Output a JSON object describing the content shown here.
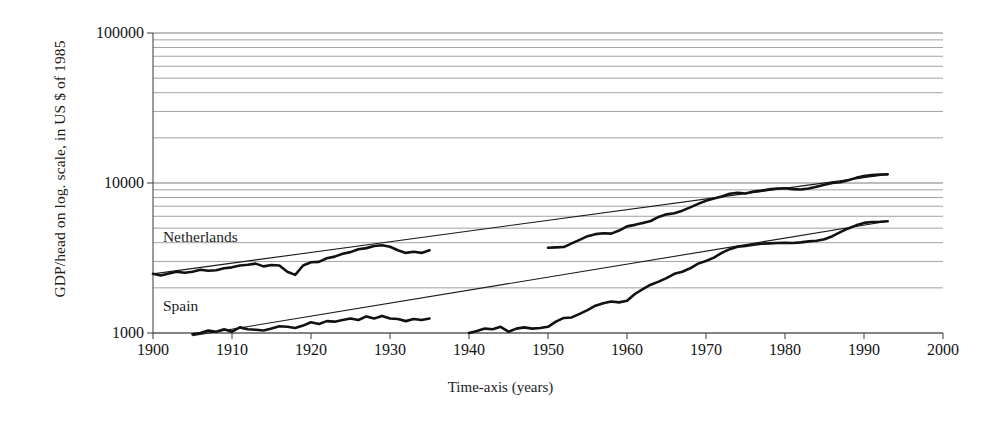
{
  "chart_data": {
    "type": "line",
    "title": "",
    "xlabel": "Time-axis (years)",
    "ylabel": "GDP/head on log. scale, in US $ of 1985",
    "yscale": "log",
    "ylim": [
      1000,
      100000
    ],
    "xlim": [
      1900,
      2000
    ],
    "grid": true,
    "grid_style": "horizontal log minor gridlines",
    "legend_position": "inline labels at left of curves",
    "ytick_labels": [
      "1000",
      "10000",
      "100000"
    ],
    "ytick_values": [
      1000,
      10000,
      100000
    ],
    "xtick_labels": [
      "1900",
      "1910",
      "1920",
      "1930",
      "1940",
      "1950",
      "1960",
      "1970",
      "1980",
      "1990",
      "2000"
    ],
    "xtick_values": [
      1900,
      1910,
      1920,
      1930,
      1940,
      1950,
      1960,
      1970,
      1980,
      1990,
      2000
    ],
    "annotations": [
      {
        "text": "Netherlands",
        "x": 1901,
        "y": 4300
      },
      {
        "text": "Spain",
        "x": 1901,
        "y": 1500
      }
    ],
    "series": [
      {
        "name": "Netherlands",
        "style": "thick black line",
        "segments": [
          {
            "label": "pre-war",
            "x": [
              1900,
              1901,
              1902,
              1903,
              1904,
              1905,
              1906,
              1907,
              1908,
              1909,
              1910,
              1911,
              1912,
              1913,
              1914,
              1915,
              1916,
              1917,
              1918,
              1919,
              1920,
              1921,
              1922,
              1923,
              1924,
              1925,
              1926,
              1927,
              1928,
              1929,
              1930,
              1931,
              1932,
              1933,
              1934,
              1935
            ],
            "y": [
              2480,
              2420,
              2490,
              2560,
              2520,
              2560,
              2640,
              2600,
              2620,
              2700,
              2740,
              2820,
              2850,
              2900,
              2780,
              2840,
              2820,
              2560,
              2440,
              2820,
              2960,
              2980,
              3150,
              3230,
              3380,
              3460,
              3620,
              3680,
              3800,
              3850,
              3760,
              3560,
              3420,
              3480,
              3420,
              3560
            ]
          },
          {
            "label": "post-war",
            "x": [
              1950,
              1951,
              1952,
              1953,
              1954,
              1955,
              1956,
              1957,
              1958,
              1959,
              1960,
              1961,
              1962,
              1963,
              1964,
              1965,
              1966,
              1967,
              1968,
              1969,
              1970,
              1971,
              1972,
              1973,
              1974,
              1975,
              1976,
              1977,
              1978,
              1979,
              1980,
              1981,
              1982,
              1983,
              1984,
              1985,
              1986,
              1987,
              1988,
              1989,
              1990,
              1991,
              1992,
              1993
            ],
            "y": [
              3700,
              3720,
              3740,
              3960,
              4180,
              4420,
              4560,
              4620,
              4600,
              4820,
              5140,
              5260,
              5420,
              5580,
              5940,
              6180,
              6280,
              6540,
              6880,
              7260,
              7620,
              7880,
              8120,
              8480,
              8620,
              8520,
              8780,
              8900,
              9080,
              9200,
              9220,
              9100,
              9050,
              9180,
              9440,
              9720,
              10020,
              10120,
              10420,
              10820,
              11120,
              11280,
              11400,
              11420
            ]
          }
        ]
      },
      {
        "name": "Spain",
        "style": "thick black line",
        "segments": [
          {
            "label": "pre-war",
            "x": [
              1905,
              1906,
              1907,
              1908,
              1909,
              1910,
              1911,
              1912,
              1913,
              1914,
              1915,
              1916,
              1917,
              1918,
              1919,
              1920,
              1921,
              1922,
              1923,
              1924,
              1925,
              1926,
              1927,
              1928,
              1929,
              1930,
              1931,
              1932,
              1933,
              1934,
              1935
            ],
            "y": [
              980,
              1000,
              1040,
              1020,
              1060,
              1020,
              1090,
              1060,
              1050,
              1040,
              1070,
              1110,
              1100,
              1080,
              1120,
              1180,
              1150,
              1200,
              1190,
              1220,
              1250,
              1220,
              1290,
              1250,
              1300,
              1250,
              1240,
              1200,
              1240,
              1220,
              1250
            ]
          },
          {
            "label": "post-war",
            "x": [
              1940,
              1941,
              1942,
              1943,
              1944,
              1945,
              1946,
              1947,
              1948,
              1949,
              1950,
              1951,
              1952,
              1953,
              1954,
              1955,
              1956,
              1957,
              1958,
              1959,
              1960,
              1961,
              1962,
              1963,
              1964,
              1965,
              1966,
              1967,
              1968,
              1969,
              1970,
              1971,
              1972,
              1973,
              1974,
              1975,
              1976,
              1977,
              1978,
              1979,
              1980,
              1981,
              1982,
              1983,
              1984,
              1985,
              1986,
              1987,
              1988,
              1989,
              1990,
              1991,
              1992,
              1993
            ],
            "y": [
              1000,
              1030,
              1070,
              1060,
              1100,
              1020,
              1070,
              1090,
              1070,
              1080,
              1100,
              1190,
              1260,
              1270,
              1340,
              1420,
              1520,
              1580,
              1620,
              1600,
              1640,
              1820,
              1960,
              2100,
              2200,
              2320,
              2480,
              2560,
              2700,
              2900,
              3020,
              3180,
              3420,
              3620,
              3760,
              3800,
              3880,
              3940,
              3960,
              3980,
              4000,
              3980,
              4020,
              4080,
              4120,
              4220,
              4420,
              4700,
              4980,
              5220,
              5420,
              5500,
              5520,
              5560
            ]
          }
        ]
      }
    ],
    "trendlines": [
      {
        "name": "Netherlands trend",
        "style": "thin black straight line",
        "from": {
          "x": 1900,
          "y": 2480
        },
        "to": {
          "x": 1993,
          "y": 11420
        }
      },
      {
        "name": "Spain trend",
        "style": "thin black straight line",
        "from": {
          "x": 1905,
          "y": 960
        },
        "to": {
          "x": 1993,
          "y": 5560
        }
      }
    ]
  }
}
